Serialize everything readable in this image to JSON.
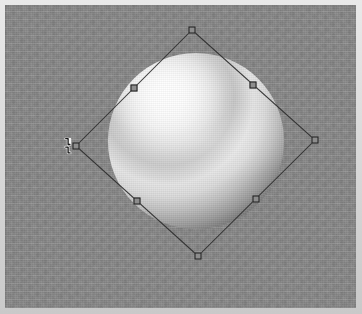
{
  "window": {
    "title": "3D Viewport",
    "width": 362,
    "height": 314,
    "frame_color": "#dcdcdc"
  },
  "viewport": {
    "name": "perspective-viewport",
    "background_color": "#878787",
    "background_style": "flat grey with dithered compression grain",
    "label": "Viewport"
  },
  "scene": {
    "object": {
      "name": "sphere",
      "type": "sphere",
      "label": "Sphere",
      "center_x": 196,
      "center_y": 141,
      "diameter": 176,
      "shading": "smooth",
      "highlight_color": "#fdfdfd",
      "shadow_color": "#141414",
      "light_direction": "upper-left",
      "selected": true
    }
  },
  "selection": {
    "label": "Selection",
    "rotated": true,
    "rotation_degrees": 45,
    "outline_color": "#2e2e2e",
    "handle_fill": "#8d8d8d",
    "handle_stroke": "#1d1d1d",
    "handle_size": 7,
    "vertices": [
      {
        "name": "top",
        "x": 192,
        "y": 30
      },
      {
        "name": "right",
        "x": 315,
        "y": 140
      },
      {
        "name": "bottom",
        "x": 198,
        "y": 256
      },
      {
        "name": "left",
        "x": 76,
        "y": 146
      }
    ],
    "handles": [
      {
        "name": "handle-top",
        "label": "Top corner handle",
        "x": 192,
        "y": 30
      },
      {
        "name": "handle-top-right",
        "label": "Top-right edge handle",
        "x": 253,
        "y": 85
      },
      {
        "name": "handle-right",
        "label": "Right corner handle",
        "x": 315,
        "y": 140
      },
      {
        "name": "handle-bottom-right",
        "label": "Bottom-right edge handle",
        "x": 256,
        "y": 199
      },
      {
        "name": "handle-bottom",
        "label": "Bottom corner handle",
        "x": 198,
        "y": 256
      },
      {
        "name": "handle-bottom-left",
        "label": "Bottom-left edge handle",
        "x": 137,
        "y": 201
      },
      {
        "name": "handle-left",
        "label": "Left corner handle",
        "x": 76,
        "y": 146
      },
      {
        "name": "handle-top-left",
        "label": "Top-left edge handle",
        "x": 134,
        "y": 88
      }
    ]
  },
  "cursor": {
    "name": "resize-cursor",
    "label": "Resize cursor",
    "icon": "resize-horizontal-cursor",
    "x": 69,
    "y": 146,
    "fill": "#1c1c1c",
    "outline": "#f2f2f2"
  }
}
